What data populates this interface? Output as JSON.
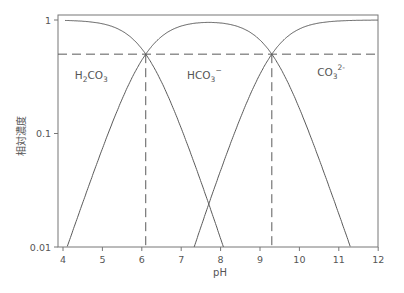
{
  "chart_data": {
    "type": "line",
    "title": "",
    "xlabel": "pH",
    "ylabel": "相対濃度",
    "xscale": "linear",
    "yscale": "log",
    "xlim": [
      4,
      12
    ],
    "ylim": [
      0.01,
      1
    ],
    "xticks": [
      4,
      5,
      6,
      7,
      8,
      9,
      10,
      11,
      12
    ],
    "xtick_labels": [
      "4",
      "5",
      "6",
      "7",
      "8",
      "9",
      "10",
      "11",
      "12"
    ],
    "yticks": [
      0.01,
      0.1,
      1
    ],
    "ytick_labels": [
      "0.01",
      "0.1",
      "1"
    ],
    "grid": false,
    "legend": null,
    "pKa": [
      6.1,
      9.3
    ],
    "series": [
      {
        "name": "H2CO3",
        "label_main": "H",
        "label_sub1": "2",
        "label_mid": "CO",
        "label_sub2": "3",
        "label_sup": "",
        "label_pos": [
          4.3,
          0.3
        ]
      },
      {
        "name": "HCO3-",
        "label_main": "HCO",
        "label_sub2": "3",
        "label_sup": "−",
        "label_pos": [
          7.15,
          0.3
        ]
      },
      {
        "name": "CO3 2-",
        "label_main": "CO",
        "label_sub2": "3",
        "label_sup": "2-",
        "label_pos": [
          10.45,
          0.32
        ]
      }
    ],
    "sample_points": {
      "x": [
        4,
        5,
        6,
        6.1,
        7,
        7.7,
        8,
        9,
        9.3,
        10,
        11,
        12
      ],
      "H2CO3": [
        0.99,
        0.93,
        0.56,
        0.5,
        0.11,
        0.02,
        0.011,
        null,
        null,
        null,
        null,
        null
      ],
      "HCO3-": [
        0.012,
        0.074,
        0.44,
        0.5,
        0.88,
        0.96,
        0.95,
        0.66,
        0.5,
        0.17,
        0.02,
        null
      ],
      "CO3 2-": [
        null,
        null,
        null,
        null,
        null,
        0.02,
        0.05,
        0.33,
        0.5,
        0.83,
        0.98,
        1.0
      ]
    },
    "annotations": [
      {
        "type": "hline",
        "y": 0.5,
        "style": "dashed"
      },
      {
        "type": "vline",
        "x": 6.1,
        "y_to": 0.5,
        "style": "dashed"
      },
      {
        "type": "vline",
        "x": 9.3,
        "y_to": 0.5,
        "style": "dashed"
      }
    ]
  },
  "colors": {
    "line": "#5a5a5a",
    "frame": "#777777",
    "text": "#555555"
  }
}
